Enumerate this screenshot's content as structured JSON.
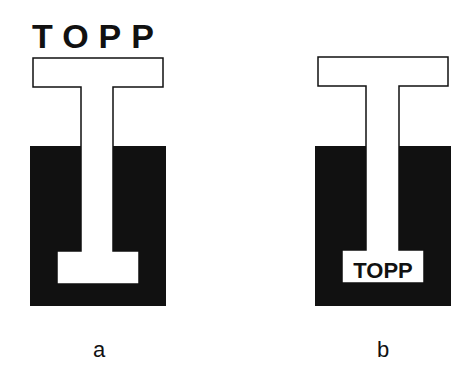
{
  "figure": {
    "panels": [
      {
        "id": "a",
        "label": "a",
        "text": "TOPP",
        "text_position": "above T-shape, outside the container"
      },
      {
        "id": "b",
        "label": "b",
        "text": "TOPP",
        "text_position": "inside bottom bar of T-shape, within the black container"
      }
    ],
    "colors": {
      "fill_dark": "#111111",
      "fill_light": "#ffffff",
      "stroke": "#111111"
    }
  }
}
